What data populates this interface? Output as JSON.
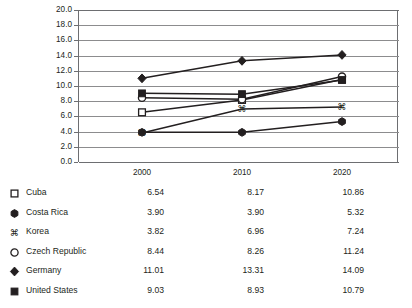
{
  "caption_partial": "",
  "chart_data": {
    "type": "line",
    "title": "",
    "subtitle": "",
    "xlabel": "",
    "ylabel": "",
    "categories": [
      "2000",
      "2010",
      "2020"
    ],
    "x_tick_labels": [
      "2000",
      "2010",
      "2020"
    ],
    "y_tick_labels": [
      "20.0",
      "18.0",
      "16.0",
      "14.0",
      "12.0",
      "10.0",
      "8.0",
      "6.0",
      "4.0",
      "2.0",
      "0.0"
    ],
    "ylim": [
      0.0,
      20.0
    ],
    "y_tick_step": 2.0,
    "grid": "horizontal",
    "legend_position": "below-as-table",
    "series": [
      {
        "name": "Cuba",
        "marker": "open-square",
        "marker_glyph": "□",
        "color": "#231f20",
        "values": [
          6.54,
          8.17,
          10.86
        ],
        "value_labels": [
          "6.54",
          "8.17",
          "10.86"
        ]
      },
      {
        "name": "Costa Rica",
        "marker": "filled-circle",
        "marker_glyph": "⬢",
        "color": "#231f20",
        "values": [
          3.9,
          3.9,
          5.32
        ],
        "value_labels": [
          "3.90",
          "3.90",
          "5.32"
        ]
      },
      {
        "name": "Korea",
        "marker": "command-symbol",
        "marker_glyph": "⌘",
        "color": "#231f20",
        "values": [
          3.82,
          6.96,
          7.24
        ],
        "value_labels": [
          "3.82",
          "6.96",
          "7.24"
        ]
      },
      {
        "name": "Czech Republic",
        "marker": "open-circle",
        "marker_glyph": "○",
        "color": "#231f20",
        "values": [
          8.44,
          8.26,
          11.24
        ],
        "value_labels": [
          "8.44",
          "8.26",
          "11.24"
        ]
      },
      {
        "name": "Germany",
        "marker": "filled-diamond",
        "marker_glyph": "◆",
        "color": "#231f20",
        "values": [
          11.01,
          13.31,
          14.09
        ],
        "value_labels": [
          "11.01",
          "13.31",
          "14.09"
        ]
      },
      {
        "name": "United States",
        "marker": "filled-square",
        "marker_glyph": "■",
        "color": "#231f20",
        "values": [
          9.03,
          8.93,
          10.79
        ],
        "value_labels": [
          "9.03",
          "8.93",
          "10.79"
        ]
      }
    ]
  },
  "table": {
    "column_headers": [
      "2000",
      "2010",
      "2020"
    ],
    "rows": [
      {
        "name": "Cuba",
        "v0": "6.54",
        "v1": "8.17",
        "v2": "10.86"
      },
      {
        "name": "Costa Rica",
        "v0": "3.90",
        "v1": "3.90",
        "v2": "5.32"
      },
      {
        "name": "Korea",
        "v0": "3.82",
        "v1": "6.96",
        "v2": "7.24"
      },
      {
        "name": "Czech Republic",
        "v0": "8.44",
        "v1": "8.26",
        "v2": "11.24"
      },
      {
        "name": "Germany",
        "v0": "11.01",
        "v1": "13.31",
        "v2": "14.09"
      },
      {
        "name": "United States",
        "v0": "9.03",
        "v1": "8.93",
        "v2": "10.79"
      }
    ]
  },
  "colors": {
    "ink": "#231f20",
    "gridline": "#8c8c8e",
    "axis": "#6d6e71",
    "background": "#ffffff"
  }
}
